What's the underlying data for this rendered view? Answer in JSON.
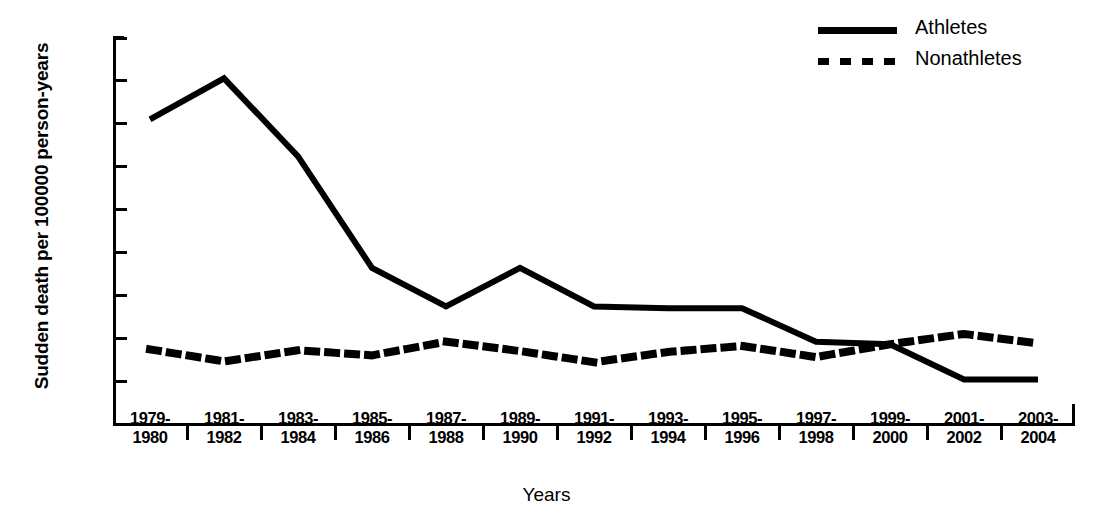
{
  "chart_data": {
    "type": "line",
    "title": "",
    "xlabel": "Years",
    "ylabel": "Sudden death per 100000 person-years",
    "categories": [
      "1979-\n1980",
      "1981-\n1982",
      "1983-\n1984",
      "1985-\n1986",
      "1987-\n1988",
      "1989-\n1990",
      "1991-\n1992",
      "1993-\n1994",
      "1995-\n1996",
      "1997-\n1998",
      "1999-\n2000",
      "2001-\n2002",
      "2003-\n2004"
    ],
    "categories_display": [
      [
        "1979-",
        "1980"
      ],
      [
        "1981-",
        "1982"
      ],
      [
        "1983-",
        "1984"
      ],
      [
        "1985-",
        "1986"
      ],
      [
        "1987-",
        "1988"
      ],
      [
        "1989-",
        "1990"
      ],
      [
        "1991-",
        "1992"
      ],
      [
        "1993-",
        "1994"
      ],
      [
        "1995-",
        "1996"
      ],
      [
        "1997-",
        "1998"
      ],
      [
        "1999-",
        "2000"
      ],
      [
        "2001-",
        "2002"
      ],
      [
        "2003-",
        "2004"
      ]
    ],
    "series": [
      {
        "name": "Athletes",
        "style": "solid",
        "color": "#000000",
        "values": [
          3.55,
          4.03,
          3.12,
          1.82,
          1.37,
          1.82,
          1.37,
          1.35,
          1.35,
          0.96,
          0.93,
          0.52,
          0.52
        ]
      },
      {
        "name": "Nonathletes",
        "style": "dotted",
        "color": "#000000",
        "values": [
          0.87,
          0.73,
          0.86,
          0.8,
          0.96,
          0.85,
          0.72,
          0.84,
          0.91,
          0.78,
          0.93,
          1.05,
          0.94
        ]
      }
    ],
    "ylim": [
      0,
      4.5
    ],
    "yticks": [
      "0",
      "0.5",
      "1.0",
      "1.5",
      "2.0",
      "2.5",
      "3.0",
      "3.5",
      "4.0",
      "4.5"
    ],
    "ytick_values": [
      0,
      0.5,
      1.0,
      1.5,
      2.0,
      2.5,
      3.0,
      3.5,
      4.0,
      4.5
    ],
    "grid": false,
    "legend_position": "top-right"
  },
  "legend": {
    "entries": [
      {
        "label": "Athletes",
        "style": "solid"
      },
      {
        "label": "Nonathletes",
        "style": "dotted"
      }
    ]
  }
}
